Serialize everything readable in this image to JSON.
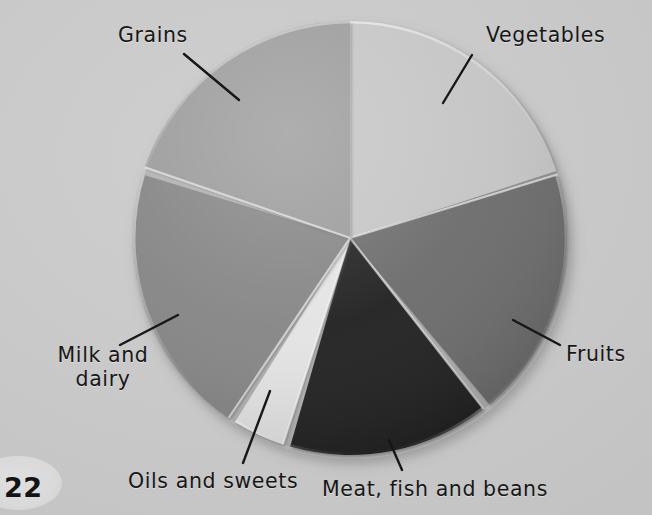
{
  "page": {
    "number": "22",
    "background_color": "#c8c8c8"
  },
  "chart_data": {
    "type": "pie",
    "title": "",
    "subtitle": "",
    "xlabel": "",
    "ylabel": "",
    "legend_position": "callout-labels",
    "grid": false,
    "center": {
      "x": 350,
      "y": 238
    },
    "radius": 217,
    "start_angle_deg": 0,
    "direction": "clockwise",
    "categories": [
      "Vegetables",
      "Fruits",
      "Meat, fish and beans",
      "Oils and sweets",
      "Milk and dairy",
      "Grains"
    ],
    "values": [
      20,
      18.5,
      15,
      4,
      20,
      22.5
    ],
    "unit": "percent",
    "slices": [
      {
        "label": "Vegetables",
        "value": 20,
        "start_deg": 0,
        "end_deg": 72,
        "color": "#c6c6c6",
        "label_x": 486,
        "label_y": 24,
        "leader": {
          "x1": 472,
          "y1": 55,
          "x2": 443,
          "y2": 103
        }
      },
      {
        "label": "Fruits",
        "value": 18.5,
        "start_deg": 73,
        "end_deg": 140,
        "color": "#6a6a6a",
        "label_x": 566,
        "label_y": 343,
        "leader": {
          "x1": 560,
          "y1": 345,
          "x2": 513,
          "y2": 320
        }
      },
      {
        "label": "Meat, fish and beans",
        "value": 15,
        "start_deg": 142,
        "end_deg": 196,
        "color": "#1d1d1d",
        "label_x": 322,
        "label_y": 478,
        "leader": {
          "x1": 402,
          "y1": 470,
          "x2": 389,
          "y2": 440
        }
      },
      {
        "label": "Oils and sweets",
        "value": 4,
        "start_deg": 198,
        "end_deg": 212,
        "color": "#e6e6e6",
        "label_x": 128,
        "label_y": 470,
        "leader": {
          "x1": 243,
          "y1": 463,
          "x2": 270,
          "y2": 391
        }
      },
      {
        "label": "Milk and dairy",
        "value": 20,
        "start_deg": 214,
        "end_deg": 287,
        "color": "#848484",
        "label_x": 44,
        "label_y": 344,
        "leader": {
          "x1": 120,
          "y1": 345,
          "x2": 178,
          "y2": 315
        }
      },
      {
        "label": "Grains",
        "value": 22.5,
        "start_deg": 289,
        "end_deg": 360,
        "color": "#9a9a9a",
        "label_x": 118,
        "label_y": 24,
        "leader": {
          "x1": 184,
          "y1": 54,
          "x2": 239,
          "y2": 100
        }
      }
    ]
  },
  "labels": {
    "grains": "Grains",
    "vegetables": "Vegetables",
    "fruits": "Fruits",
    "milk_and_dairy": "Milk and\ndairy",
    "milk_line1": "Milk and",
    "milk_line2": "dairy",
    "oils_and_sweets": "Oils and sweets",
    "meat_fish_and_beans": "Meat, fish and beans"
  }
}
